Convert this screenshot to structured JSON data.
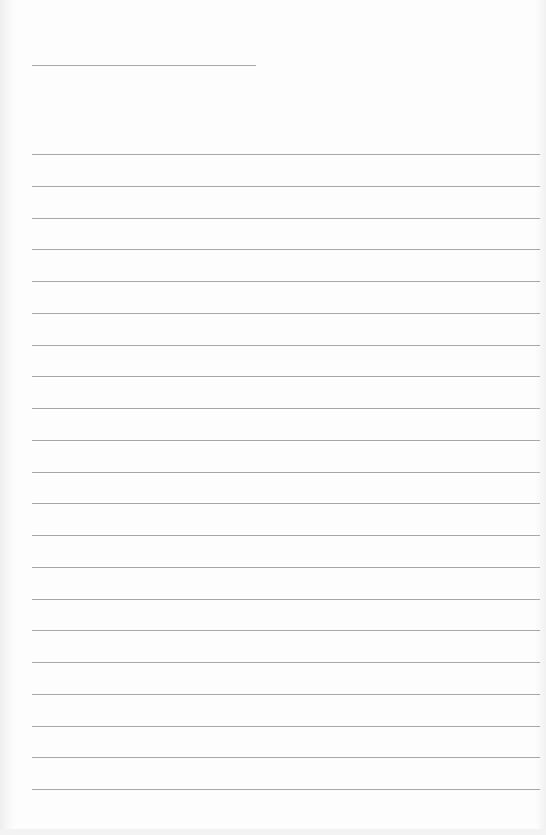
{
  "page": {
    "type": "lined-paper",
    "header_line": {
      "x": 32,
      "y": 65,
      "width": 224
    },
    "ruled_lines": {
      "count": 21,
      "start_y": 154,
      "spacing": 31.75,
      "x": 32,
      "width": 508
    },
    "line_color": "#a8a8a8",
    "background": "#fdfdfd"
  }
}
